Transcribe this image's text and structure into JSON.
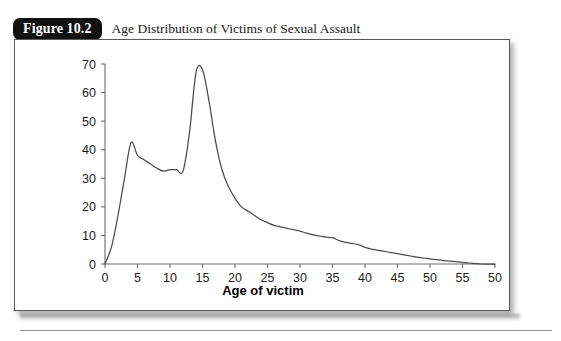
{
  "figure": {
    "badge_label": "Figure 10.2",
    "caption": "Age Distribution of Victims of Sexual Assault"
  },
  "chart_data": {
    "type": "line",
    "title": "Age Distribution of Victims of Sexual Assault",
    "xlabel": "Age of victim",
    "ylabel": "",
    "xlim": [
      0,
      60
    ],
    "ylim": [
      0,
      70
    ],
    "grid": false,
    "legend": null,
    "xticks": [
      0,
      5,
      10,
      15,
      20,
      25,
      30,
      35,
      40,
      45,
      50,
      55,
      60
    ],
    "xtick_labels": [
      "0",
      "5",
      "10",
      "15",
      "20",
      "25",
      "30",
      "35",
      "40",
      "45",
      "50",
      "55",
      "50"
    ],
    "yticks": [
      0,
      10,
      20,
      30,
      40,
      50,
      60,
      70
    ],
    "ytick_labels": [
      "0",
      "10",
      "20",
      "30",
      "40",
      "50",
      "60",
      "70"
    ],
    "note": "Bimodal distribution: a small early peak near age 4 and a tall peak near age 14, with a long right tail reaching zero around age 58.",
    "series": [
      {
        "name": "Victims",
        "x": [
          0,
          1,
          2,
          3,
          4,
          5,
          6,
          7,
          8,
          9,
          10,
          11,
          12,
          13,
          14,
          15,
          16,
          17,
          18,
          19,
          20,
          21,
          22,
          23,
          24,
          25,
          26,
          27,
          28,
          29,
          30,
          31,
          32,
          33,
          34,
          35,
          36,
          37,
          38,
          39,
          40,
          41,
          42,
          43,
          44,
          45,
          46,
          47,
          48,
          49,
          50,
          51,
          52,
          53,
          54,
          55,
          56,
          57,
          58,
          59,
          60
        ],
        "y": [
          0,
          6,
          17,
          30,
          42.5,
          38,
          36.5,
          35,
          33.5,
          32.5,
          33,
          33,
          32.5,
          46,
          67,
          68,
          57,
          43,
          33,
          27,
          23,
          20,
          18.5,
          17,
          15.5,
          14.5,
          13.5,
          13,
          12.5,
          12,
          11.5,
          10.8,
          10.2,
          9.8,
          9.4,
          9.2,
          8.2,
          7.6,
          7.2,
          6.8,
          5.8,
          5.2,
          4.8,
          4.4,
          4,
          3.6,
          3.2,
          2.8,
          2.4,
          2.1,
          1.8,
          1.5,
          1.2,
          1,
          0.8,
          0.6,
          0.35,
          0.15,
          0,
          0,
          0
        ]
      }
    ]
  }
}
